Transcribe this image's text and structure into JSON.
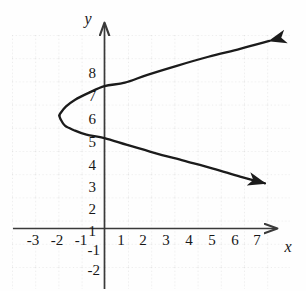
{
  "figure": {
    "kind": "coordinate-graph",
    "background_color": "#fefefe",
    "curve_color": "#1b1b1b",
    "axis_color": "#3a3a3a",
    "grid_color": "#d8d8d8"
  },
  "axes": {
    "x_axis_label": "x",
    "y_axis_label": "y",
    "x_tick_labels": [
      "-3",
      "-2",
      "-1",
      "1",
      "2",
      "3",
      "4",
      "5",
      "6",
      "7"
    ],
    "y_tick_labels": [
      "8",
      "7",
      "6",
      "5",
      "4",
      "3",
      "2",
      "1",
      "-1",
      "-2"
    ],
    "x_has_arrow": true,
    "y_has_arrow": true
  },
  "chart_data": {
    "type": "line",
    "title": "",
    "xlabel": "x",
    "ylabel": "y",
    "xlim": [
      -3.5,
      7.8
    ],
    "ylim": [
      -2.6,
      9.0
    ],
    "grid": true,
    "grid_style": "dotted",
    "legend": "none",
    "x_ticks": [
      -3,
      -2,
      -1,
      1,
      2,
      3,
      4,
      5,
      6,
      7
    ],
    "y_ticks": [
      8,
      7,
      6,
      5,
      4,
      3,
      2,
      1,
      -1,
      -2
    ],
    "series": [
      {
        "name": "sideways parabola",
        "orientation": "opens-right",
        "vertex": [
          -2.0,
          5.0
        ],
        "y_intercepts": [
          6.3,
          4.0
        ],
        "arrow_ends": [
          [
            7.3,
            8.3
          ],
          [
            7.1,
            2.0
          ]
        ],
        "points": [
          [
            7.3,
            8.3
          ],
          [
            6.0,
            7.95
          ],
          [
            4.6,
            7.6
          ],
          [
            3.2,
            7.2
          ],
          [
            1.9,
            6.8
          ],
          [
            0.9,
            6.45
          ],
          [
            0.0,
            6.3
          ],
          [
            -0.7,
            6.0
          ],
          [
            -1.3,
            5.7
          ],
          [
            -1.7,
            5.4
          ],
          [
            -1.95,
            5.1
          ],
          [
            -2.0,
            5.0
          ],
          [
            -1.95,
            4.85
          ],
          [
            -1.75,
            4.55
          ],
          [
            -1.35,
            4.35
          ],
          [
            -0.8,
            4.15
          ],
          [
            0.0,
            4.0
          ],
          [
            1.0,
            3.7
          ],
          [
            2.2,
            3.35
          ],
          [
            3.5,
            3.0
          ],
          [
            4.8,
            2.65
          ],
          [
            6.0,
            2.3
          ],
          [
            7.1,
            2.0
          ]
        ]
      }
    ]
  }
}
